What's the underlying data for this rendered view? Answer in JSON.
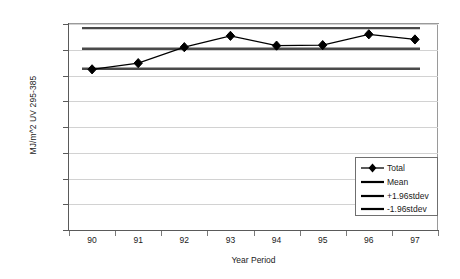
{
  "chart_data": {
    "type": "line",
    "title": "",
    "xlabel": "Year Period",
    "ylabel": "MJ/m^2 UV 295-385",
    "categories": [
      "90",
      "91",
      "92",
      "93",
      "94",
      "95",
      "96",
      "97"
    ],
    "ylim": [
      0,
      400
    ],
    "yticks": [
      "0.00",
      "50.00",
      "100.00",
      "150.00",
      "200.00",
      "250.00",
      "300.00",
      "350.00",
      "400.00"
    ],
    "ytick_values": [
      0,
      50,
      100,
      150,
      200,
      250,
      300,
      350,
      400
    ],
    "grid": true,
    "legend_position": "inside-bottom-right",
    "series": [
      {
        "name": "Total",
        "style": "line-marker",
        "marker": "diamond",
        "color": "#000000",
        "values": [
          312,
          324,
          355,
          377,
          358,
          359,
          380,
          370
        ]
      },
      {
        "name": "Mean",
        "style": "constant-line",
        "color": "#4a4a4a",
        "value": 352
      },
      {
        "name": "+1.96stdev",
        "style": "constant-line",
        "color": "#4a4a4a",
        "value": 392
      },
      {
        "name": "-1.96stdev",
        "style": "constant-line",
        "color": "#4a4a4a",
        "value": 313
      }
    ]
  },
  "legend": {
    "entries": [
      {
        "label": "Total"
      },
      {
        "label": "Mean"
      },
      {
        "label": "+1.96stdev"
      },
      {
        "label": "-1.96stdev"
      }
    ]
  },
  "axes": {
    "y_title": "MJ/m^2 UV 295-385",
    "x_title": "Year Period"
  }
}
